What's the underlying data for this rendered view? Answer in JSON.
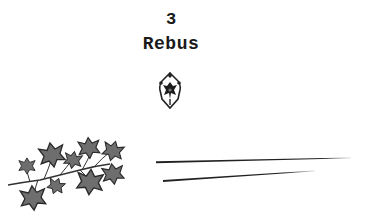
{
  "page": {
    "chapter_number": "3",
    "chapter_title": "Rebus"
  },
  "decorations": {
    "ornament_icon": "fleuron-ornament-icon",
    "ivy_icon": "ivy-branch-icon",
    "rule_lines": 2
  },
  "colors": {
    "text": "#1a1a1a",
    "leaf_fill": "#6e6e6e",
    "leaf_edge": "#2a2a2a",
    "rule": "#222222",
    "background": "#ffffff"
  }
}
